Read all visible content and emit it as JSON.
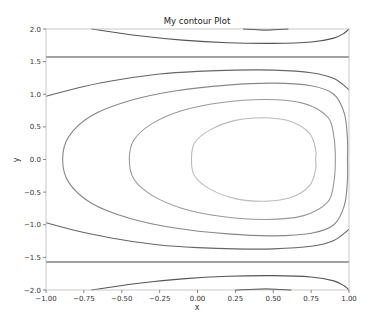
{
  "chart_data": {
    "type": "contour",
    "title": "My contour Plot",
    "xlabel": "x",
    "ylabel": "y",
    "xlim": [
      -1.0,
      1.0
    ],
    "ylim": [
      -2.0,
      2.0
    ],
    "xticks": [
      "-1.00",
      "-0.75",
      "-0.50",
      "-0.25",
      "0.00",
      "0.25",
      "0.50",
      "0.75",
      "1.00"
    ],
    "yticks": [
      "-2.0",
      "-1.5",
      "-1.0",
      "-0.5",
      "0.0",
      "0.5",
      "1.0",
      "1.5",
      "2.0"
    ],
    "grid": false,
    "legend": null,
    "contours": [
      {
        "name": "top-outer",
        "color": "#555555",
        "closed": false,
        "points": [
          [
            -0.7,
            2.0
          ],
          [
            -0.4,
            1.9
          ],
          [
            -0.1,
            1.83
          ],
          [
            0.2,
            1.79
          ],
          [
            0.5,
            1.78
          ],
          [
            0.75,
            1.8
          ],
          [
            0.9,
            1.86
          ],
          [
            0.97,
            1.94
          ],
          [
            1.0,
            2.0
          ]
        ]
      },
      {
        "name": "top-small",
        "color": "#222222",
        "closed": false,
        "points": [
          [
            0.3,
            2.0
          ],
          [
            0.45,
            1.985
          ],
          [
            0.6,
            2.0
          ]
        ]
      },
      {
        "name": "top-horizontal",
        "color": "#444444",
        "closed": false,
        "points": [
          [
            -1.0,
            1.5708
          ],
          [
            1.0,
            1.5708
          ]
        ]
      },
      {
        "name": "upper-open",
        "color": "#666666",
        "closed": false,
        "points": [
          [
            -1.0,
            0.97
          ],
          [
            -0.75,
            1.12
          ],
          [
            -0.5,
            1.23
          ],
          [
            -0.25,
            1.31
          ],
          [
            0.0,
            1.35
          ],
          [
            0.25,
            1.37
          ],
          [
            0.5,
            1.37
          ],
          [
            0.75,
            1.33
          ],
          [
            0.9,
            1.24
          ],
          [
            1.0,
            1.07
          ]
        ]
      },
      {
        "name": "lower-open",
        "color": "#666666",
        "closed": false,
        "points": [
          [
            -1.0,
            -0.97
          ],
          [
            -0.75,
            -1.12
          ],
          [
            -0.5,
            -1.23
          ],
          [
            -0.25,
            -1.31
          ],
          [
            0.0,
            -1.35
          ],
          [
            0.25,
            -1.37
          ],
          [
            0.5,
            -1.37
          ],
          [
            0.75,
            -1.33
          ],
          [
            0.9,
            -1.24
          ],
          [
            1.0,
            -1.07
          ]
        ]
      },
      {
        "name": "bottom-horizontal",
        "color": "#444444",
        "closed": false,
        "points": [
          [
            -1.0,
            -1.5708
          ],
          [
            1.0,
            -1.5708
          ]
        ]
      },
      {
        "name": "bottom-outer",
        "color": "#555555",
        "closed": false,
        "points": [
          [
            -0.7,
            -2.0
          ],
          [
            -0.4,
            -1.9
          ],
          [
            -0.1,
            -1.83
          ],
          [
            0.2,
            -1.79
          ],
          [
            0.5,
            -1.78
          ],
          [
            0.75,
            -1.8
          ],
          [
            0.9,
            -1.86
          ],
          [
            0.97,
            -1.94
          ],
          [
            1.0,
            -2.0
          ]
        ]
      },
      {
        "name": "bottom-small",
        "color": "#222222",
        "closed": false,
        "points": [
          [
            0.25,
            -2.0
          ],
          [
            0.45,
            -1.985
          ],
          [
            0.62,
            -2.0
          ]
        ]
      },
      {
        "name": "oval-outer",
        "color": "#888888",
        "closed": true,
        "points": [
          [
            -0.89,
            0.0
          ],
          [
            -0.85,
            0.35
          ],
          [
            -0.7,
            0.67
          ],
          [
            -0.45,
            0.9
          ],
          [
            -0.15,
            1.05
          ],
          [
            0.2,
            1.14
          ],
          [
            0.5,
            1.17
          ],
          [
            0.75,
            1.13
          ],
          [
            0.9,
            1.0
          ],
          [
            0.97,
            0.7
          ],
          [
            0.99,
            0.3
          ],
          [
            0.99,
            0.0
          ],
          [
            0.99,
            -0.3
          ],
          [
            0.97,
            -0.7
          ],
          [
            0.9,
            -1.0
          ],
          [
            0.75,
            -1.13
          ],
          [
            0.5,
            -1.17
          ],
          [
            0.2,
            -1.14
          ],
          [
            -0.15,
            -1.05
          ],
          [
            -0.45,
            -0.9
          ],
          [
            -0.7,
            -0.67
          ],
          [
            -0.85,
            -0.35
          ]
        ]
      },
      {
        "name": "oval-middle",
        "color": "#999999",
        "closed": true,
        "points": [
          [
            -0.45,
            0.0
          ],
          [
            -0.42,
            0.3
          ],
          [
            -0.3,
            0.55
          ],
          [
            -0.1,
            0.75
          ],
          [
            0.15,
            0.87
          ],
          [
            0.45,
            0.92
          ],
          [
            0.7,
            0.86
          ],
          [
            0.86,
            0.65
          ],
          [
            0.9,
            0.35
          ],
          [
            0.91,
            0.0
          ],
          [
            0.9,
            -0.35
          ],
          [
            0.86,
            -0.65
          ],
          [
            0.7,
            -0.86
          ],
          [
            0.45,
            -0.92
          ],
          [
            0.15,
            -0.87
          ],
          [
            -0.1,
            -0.75
          ],
          [
            -0.3,
            -0.55
          ],
          [
            -0.42,
            -0.3
          ]
        ]
      },
      {
        "name": "oval-inner",
        "color": "#bbbbbb",
        "closed": true,
        "points": [
          [
            -0.04,
            0.0
          ],
          [
            -0.02,
            0.25
          ],
          [
            0.08,
            0.45
          ],
          [
            0.25,
            0.6
          ],
          [
            0.45,
            0.64
          ],
          [
            0.62,
            0.58
          ],
          [
            0.74,
            0.4
          ],
          [
            0.78,
            0.15
          ],
          [
            0.78,
            0.0
          ],
          [
            0.78,
            -0.15
          ],
          [
            0.74,
            -0.4
          ],
          [
            0.62,
            -0.58
          ],
          [
            0.45,
            -0.64
          ],
          [
            0.25,
            -0.6
          ],
          [
            0.08,
            -0.45
          ],
          [
            -0.02,
            -0.25
          ]
        ]
      }
    ]
  },
  "plot_area": {
    "left": 46,
    "top": 29,
    "right": 349,
    "bottom": 290
  }
}
